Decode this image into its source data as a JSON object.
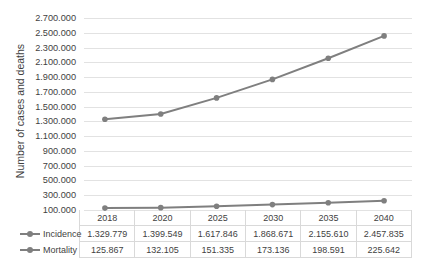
{
  "chart_data": {
    "type": "line",
    "title": "",
    "xlabel": "",
    "ylabel": "Number of cases and deaths",
    "categories": [
      "2018",
      "2020",
      "2025",
      "2030",
      "2035",
      "2040"
    ],
    "ylim": [
      0,
      2700000
    ],
    "ytick_start": 100000,
    "ytick_step": 200000,
    "grid": true,
    "legend_position": "table-left",
    "ytick_labels": [
      "2.700.000",
      "2.500.000",
      "2.300.000",
      "2.100.000",
      "1.900.000",
      "1.700.000",
      "1.500.000",
      "1.300.000",
      "1.100.000",
      "900.000",
      "700.000",
      "500.000",
      "300.000",
      "100.000"
    ],
    "series": [
      {
        "name": "Incidence",
        "color": "#7f7f7f",
        "values": [
          1329779,
          1399549,
          1617846,
          1868671,
          2155610,
          2457835
        ],
        "labels": [
          "1.329.779",
          "1.399.549",
          "1.617.846",
          "1.868.671",
          "2.155.610",
          "2.457.835"
        ]
      },
      {
        "name": "Mortality",
        "color": "#7f7f7f",
        "values": [
          125867,
          132105,
          151335,
          173136,
          198591,
          225642
        ],
        "labels": [
          "125.867",
          "132.105",
          "151.335",
          "173.136",
          "198.591",
          "225.642"
        ]
      }
    ]
  },
  "colors": {
    "series": "#7f7f7f",
    "gridline": "#e2e2e2",
    "table_border": "#d9d9d9",
    "text": "#3f3f3f"
  }
}
